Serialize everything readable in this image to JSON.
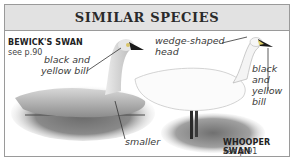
{
  "header": {
    "title": "SIMILAR SPECIES"
  },
  "species": [
    {
      "name": "BEWICK'S SWAN",
      "ref": "see p.90"
    },
    {
      "name": "WHOOPER SWAN",
      "ref": "see p.91"
    }
  ],
  "annotations": {
    "bewick_bill_1": "black and",
    "bewick_bill_2": "yellow bill",
    "bewick_size": "smaller",
    "whooper_head_1": "wedge-shaped",
    "whooper_head_2": "head",
    "whooper_bill_1": "black",
    "whooper_bill_2": "and",
    "whooper_bill_3": "yellow",
    "whooper_bill_4": "bill"
  },
  "colors": {
    "header_bg": "#e2e2e2",
    "border": "#9a9a9a",
    "text": "#2a2a2a"
  }
}
